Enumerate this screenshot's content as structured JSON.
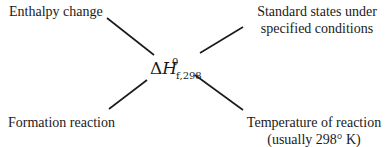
{
  "diagram": {
    "center": {
      "delta": "Δ",
      "symbol": "H",
      "superscript": "0",
      "subscript": "f,298"
    },
    "labels": {
      "top_left": "Enthalpy change",
      "top_right_line1": "Standard states under",
      "top_right_line2": "specified conditions",
      "bottom_left": "Formation reaction",
      "bottom_right_line1": "Temperature of reaction",
      "bottom_right_line2": "(usually 298° K)"
    },
    "line_color": "#1a1a1a"
  }
}
